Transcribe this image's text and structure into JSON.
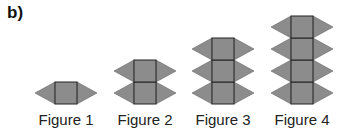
{
  "part_label": "b)",
  "colors": {
    "fill": "#8c8c8c",
    "stroke": "#222222"
  },
  "figures": [
    {
      "label": "Figure 1",
      "squares": 1,
      "cx": 66,
      "labelX": 26
    },
    {
      "label": "Figure 2",
      "squares": 2,
      "cx": 145,
      "labelX": 105
    },
    {
      "label": "Figure 3",
      "squares": 3,
      "cx": 223,
      "labelX": 183
    },
    {
      "label": "Figure 4",
      "squares": 4,
      "cx": 302,
      "labelX": 262
    }
  ],
  "geometry": {
    "square": 22,
    "triangle_depth": 20,
    "baseline_y": 104
  }
}
